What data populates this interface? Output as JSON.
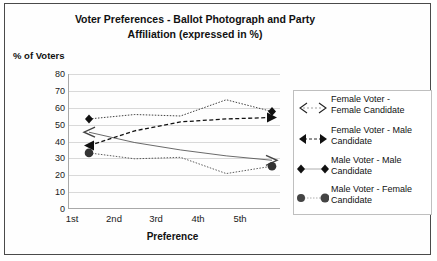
{
  "chart_data": {
    "type": "line",
    "title": "Voter Preferences - Ballot Photograph and Party Affiliation (expressed in %)",
    "title_line1": "Voter Preferences - Ballot Photograph and Party",
    "title_line2": "Affiliation (expressed in %)",
    "xlabel": "Preference",
    "ylabel": "% of Voters",
    "categories": [
      "1st",
      "2nd",
      "3rd",
      "4th",
      "5th"
    ],
    "yticks": [
      80,
      70,
      60,
      50,
      40,
      30,
      20,
      10,
      0
    ],
    "ylim": [
      0,
      80
    ],
    "grid": true,
    "legend_position": "right",
    "series": [
      {
        "name": "Female Voter - Female Candidate",
        "name_line1": "Female Voter -",
        "name_line2": "Female Candidate",
        "marker": "open-arrow",
        "line_style": "solid-thin",
        "color": "#444444",
        "values": [
          52,
          45,
          40,
          36,
          33
        ]
      },
      {
        "name": "Female Voter - Male Candidate",
        "name_line1": "Female Voter - Male",
        "name_line2": "Candidate",
        "marker": "filled-arrow",
        "line_style": "dashed",
        "color": "#111111",
        "values": [
          43,
          53,
          59,
          61,
          62
        ]
      },
      {
        "name": "Male Voter - Male Candidate",
        "name_line1": "Male Voter - Male",
        "name_line2": "Candidate",
        "marker": "diamond",
        "line_style": "dotted-thin",
        "color": "#111111",
        "values": [
          61,
          64,
          63,
          74,
          66
        ]
      },
      {
        "name": "Male Voter - Female Candidate",
        "name_line1": "Male Voter - Female",
        "name_line2": "Candidate",
        "marker": "circle",
        "line_style": "dotted-thin",
        "color": "#333333",
        "values": [
          38,
          34,
          35,
          24,
          29
        ]
      }
    ]
  }
}
